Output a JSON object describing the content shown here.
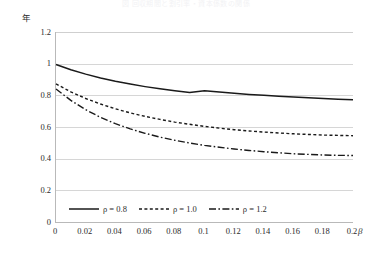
{
  "figure": {
    "title": "図 回収期間と割引率・資本係数の関係",
    "y_unit_label": "年",
    "x_axis_label": "β"
  },
  "chart_data": {
    "type": "line",
    "title": "図 回収期間と割引率・資本係数の関係",
    "xlabel": "β",
    "ylabel": "年",
    "xlim": [
      0,
      0.2
    ],
    "ylim": [
      0,
      1.2
    ],
    "xticks": [
      "0",
      "0.02",
      "0.04",
      "0.06",
      "0.08",
      "0.1",
      "0.12",
      "0.14",
      "0.16",
      "0.18",
      "0.2"
    ],
    "yticks": [
      "0",
      "0.2",
      "0.4",
      "0.6",
      "0.8",
      "1",
      "1.2"
    ],
    "grid": "horizontal",
    "legend_position": "bottom",
    "x": [
      0,
      0.01,
      0.02,
      0.03,
      0.04,
      0.05,
      0.06,
      0.07,
      0.08,
      0.09,
      0.1,
      0.11,
      0.12,
      0.13,
      0.14,
      0.15,
      0.16,
      0.17,
      0.18,
      0.19,
      0.2
    ],
    "series": [
      {
        "name": "ρ = 0.8",
        "style": "solid",
        "color": "#1a1a1a",
        "values": [
          0.995,
          0.962,
          0.934,
          0.91,
          0.889,
          0.871,
          0.855,
          0.841,
          0.829,
          0.818,
          0.829,
          0.821,
          0.813,
          0.806,
          0.8,
          0.794,
          0.789,
          0.784,
          0.78,
          0.776,
          0.772
        ]
      },
      {
        "name": "ρ = 1.0",
        "style": "dotted",
        "color": "#1a1a1a",
        "values": [
          0.872,
          0.822,
          0.78,
          0.745,
          0.715,
          0.689,
          0.667,
          0.648,
          0.631,
          0.617,
          0.604,
          0.593,
          0.583,
          0.575,
          0.568,
          0.562,
          0.557,
          0.553,
          0.549,
          0.547,
          0.545
        ]
      },
      {
        "name": "ρ = 1.2",
        "style": "dash-dot",
        "color": "#1a1a1a",
        "values": [
          0.84,
          0.768,
          0.709,
          0.661,
          0.621,
          0.588,
          0.56,
          0.536,
          0.516,
          0.499,
          0.484,
          0.472,
          0.461,
          0.452,
          0.444,
          0.437,
          0.431,
          0.427,
          0.423,
          0.421,
          0.42
        ]
      }
    ]
  },
  "legend": {
    "items": [
      {
        "label": "ρ = 0.8",
        "style": "solid"
      },
      {
        "label": "ρ = 1.0",
        "style": "dotted"
      },
      {
        "label": "ρ = 1.2",
        "style": "dash-dot"
      }
    ]
  }
}
